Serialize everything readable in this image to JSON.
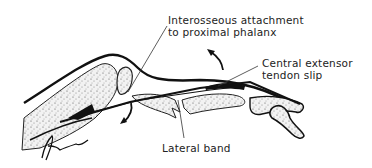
{
  "diagram": {
    "colors": {
      "ink": "#111111",
      "bone_fill": "#e6e6e6",
      "text": "#222222",
      "background": "#ffffff"
    },
    "labels": {
      "interosseous": {
        "line1": "Interosseous attachment",
        "line2": "to proximal phalanx"
      },
      "central_slip": {
        "line1": "Central extensor",
        "line2": "tendon slip"
      },
      "lateral_band": {
        "line1": "Lateral band"
      }
    },
    "signature": "artist-signature"
  }
}
